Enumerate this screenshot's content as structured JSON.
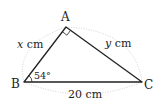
{
  "diagram": {
    "type": "right-triangle",
    "vertices": {
      "A": {
        "label": "A",
        "x": 66,
        "y": 27
      },
      "B": {
        "label": "B",
        "x": 24,
        "y": 82
      },
      "C": {
        "label": "C",
        "x": 142,
        "y": 82
      }
    },
    "sides": {
      "AB": {
        "var": "x",
        "unit": " cm"
      },
      "AC": {
        "var": "y",
        "unit": " cm"
      },
      "BC": {
        "label": "20 cm"
      }
    },
    "angle_B": {
      "label": "54°"
    },
    "right_angle_at": "A",
    "colors": {
      "line": "#222222",
      "dotted": "#bbbbbb"
    }
  }
}
